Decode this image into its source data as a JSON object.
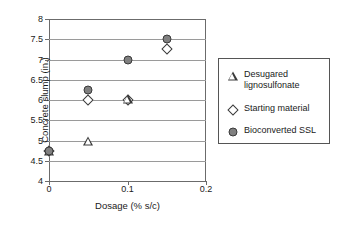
{
  "chart_data": {
    "type": "scatter",
    "title": "",
    "xlabel": "Dosage (% s/c)",
    "ylabel": "Concrete slump (in.)",
    "xlim": [
      0,
      0.2
    ],
    "ylim": [
      4,
      8
    ],
    "xticks": [
      "0",
      "0.1",
      "0.2"
    ],
    "xtick_values": [
      0,
      0.1,
      0.2
    ],
    "yticks": [
      "4",
      "4.5",
      "5",
      "5.5",
      "6",
      "6.5",
      "7",
      "7.5",
      "8"
    ],
    "ytick_values": [
      4,
      4.5,
      5,
      5.5,
      6,
      6.5,
      7,
      7.5,
      8
    ],
    "grid": true,
    "grid_axis": "y",
    "legend_position": "right",
    "series": [
      {
        "name": "Desugared lignosulfonate",
        "marker": "triangle-open",
        "color": "#3a3a3a",
        "x": [
          0,
          0.05,
          0.1
        ],
        "y": [
          4.75,
          5.22,
          6.47
        ]
      },
      {
        "name": "Starting material",
        "marker": "diamond-open",
        "color": "#3a3a3a",
        "x": [
          0,
          0.05,
          0.1,
          0.15
        ],
        "y": [
          4.75,
          6.0,
          6.0,
          7.25
        ]
      },
      {
        "name": "Bioconverted SSL",
        "marker": "circle-filled",
        "color": "#808080",
        "x": [
          0,
          0.05,
          0.1,
          0.15
        ],
        "y": [
          4.75,
          6.25,
          7.0,
          7.5
        ]
      }
    ]
  },
  "legend": {
    "entries": [
      {
        "label": "Desugared\nlignosulfonate",
        "icon": "triangle-open-icon"
      },
      {
        "label": "Starting material",
        "icon": "diamond-open-icon"
      },
      {
        "label": "Bioconverted SSL",
        "icon": "circle-filled-icon"
      }
    ]
  },
  "colors": {
    "marker_fill": "#808080",
    "marker_edge": "#3a3a3a",
    "grid": "#9a9a9a",
    "axis": "#6b6b6b",
    "background": "#ffffff"
  }
}
